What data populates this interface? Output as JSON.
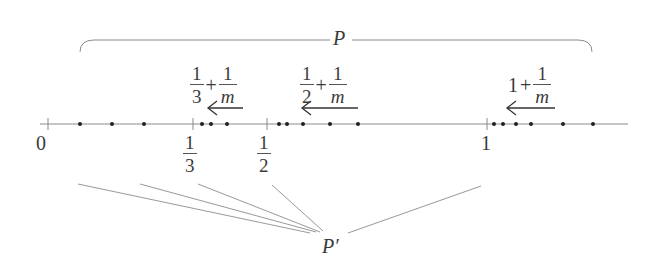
{
  "diagram": {
    "set_labels": {
      "top": "P",
      "bottom": "P′"
    },
    "axis": {
      "ticks": [
        {
          "label_type": "plain",
          "label": "0",
          "x": 48
        },
        {
          "label_type": "fraction",
          "num": "1",
          "den": "3",
          "x": 193
        },
        {
          "label_type": "fraction",
          "num": "1",
          "den": "2",
          "x": 267
        },
        {
          "label_type": "plain",
          "label": "1",
          "x": 487
        }
      ]
    },
    "limit_annotations": [
      {
        "id": "third",
        "lhs_num": "1",
        "lhs_den": "3",
        "op": "+",
        "rhs_num": "1",
        "rhs_den": "m",
        "arrow": "left-arrow"
      },
      {
        "id": "half",
        "lhs_num": "1",
        "lhs_den": "2",
        "op": "+",
        "rhs_num": "1",
        "rhs_den": "m",
        "arrow": "left-arrow"
      },
      {
        "id": "one",
        "lhs": "1",
        "op": "+",
        "rhs_num": "1",
        "rhs_den": "m",
        "arrow": "left-arrow"
      }
    ],
    "points": {
      "between_0_and_third": [
        80,
        112,
        144
      ],
      "after_third": [
        202,
        211,
        227
      ],
      "after_half": [
        279,
        287,
        303,
        330,
        358
      ],
      "after_one": [
        494,
        503,
        516,
        531,
        563,
        593
      ]
    },
    "colors": {
      "line": "#8a8a8a",
      "dot": "#222222",
      "text": "#3a3a3a"
    }
  }
}
